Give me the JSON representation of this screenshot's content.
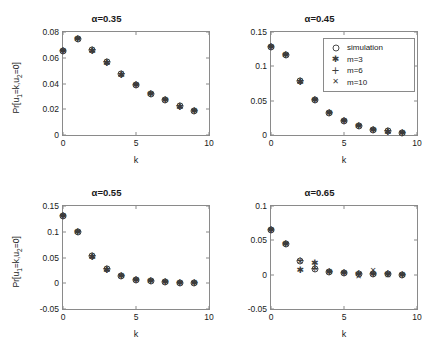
{
  "figure": {
    "background": "#ffffff",
    "axis_color": "#8a8a8a",
    "marker_color": "#3b3b3b"
  },
  "legend": {
    "position": "subplot-2-upper-right",
    "entries": [
      {
        "label": "simulation",
        "marker": "circle"
      },
      {
        "label": "m=3",
        "marker": "asterisk"
      },
      {
        "label": "m=6",
        "marker": "plus"
      },
      {
        "label": "m=10",
        "marker": "cross"
      }
    ]
  },
  "chart_data": [
    {
      "type": "scatter",
      "title": "α=0.35",
      "xlabel": "k",
      "ylabel": "Pr[u1=k,u2=0]",
      "xlim": [
        0,
        10
      ],
      "ylim": [
        0,
        0.08
      ],
      "xticks": [
        0,
        5,
        10
      ],
      "xticklabels": [
        "0",
        "5",
        "10"
      ],
      "yticks": [
        0,
        0.02,
        0.04,
        0.06,
        0.08
      ],
      "yticklabels": [
        "0",
        "0.02",
        "0.04",
        "0.06",
        "0.08"
      ],
      "grid": false,
      "x": [
        0,
        1,
        2,
        3,
        4,
        5,
        6,
        7,
        8,
        9
      ],
      "series": [
        {
          "name": "simulation",
          "marker": "circle",
          "values": [
            0.0655,
            0.0742,
            0.0662,
            0.0565,
            0.047,
            0.0388,
            0.0322,
            0.027,
            0.0222,
            0.0188
          ]
        },
        {
          "name": "m=3",
          "marker": "asterisk",
          "values": [
            0.0655,
            0.0742,
            0.0655,
            0.0562,
            0.0468,
            0.0387,
            0.0321,
            0.0269,
            0.0221,
            0.0187
          ]
        },
        {
          "name": "m=6",
          "marker": "plus",
          "values": [
            0.0655,
            0.0742,
            0.066,
            0.0564,
            0.047,
            0.0388,
            0.0322,
            0.027,
            0.0222,
            0.0188
          ]
        },
        {
          "name": "m=10",
          "marker": "cross",
          "values": [
            0.0655,
            0.0742,
            0.0661,
            0.0565,
            0.047,
            0.0388,
            0.0322,
            0.027,
            0.0222,
            0.0188
          ]
        }
      ]
    },
    {
      "type": "scatter",
      "title": "α=0.45",
      "xlabel": "k",
      "ylabel": "",
      "xlim": [
        0,
        10
      ],
      "ylim": [
        0,
        0.15
      ],
      "xticks": [
        0,
        5,
        10
      ],
      "xticklabels": [
        "0",
        "5",
        "10"
      ],
      "yticks": [
        0,
        0.05,
        0.1,
        0.15
      ],
      "yticklabels": [
        "0",
        "0.05",
        "0.1",
        "0.15"
      ],
      "grid": false,
      "x": [
        0,
        1,
        2,
        3,
        4,
        5,
        6,
        7,
        8,
        9
      ],
      "series": [
        {
          "name": "simulation",
          "marker": "circle",
          "values": [
            0.1282,
            0.1172,
            0.079,
            0.0515,
            0.0322,
            0.0208,
            0.0128,
            0.008,
            0.0052,
            0.0034
          ]
        },
        {
          "name": "m=3",
          "marker": "asterisk",
          "values": [
            0.1282,
            0.1172,
            0.0772,
            0.0505,
            0.0318,
            0.0205,
            0.0126,
            0.0078,
            0.005,
            0.0032
          ]
        },
        {
          "name": "m=6",
          "marker": "plus",
          "values": [
            0.1282,
            0.1172,
            0.0786,
            0.0512,
            0.0321,
            0.0207,
            0.0128,
            0.008,
            0.0052,
            0.0034
          ]
        },
        {
          "name": "m=10",
          "marker": "cross",
          "values": [
            0.1282,
            0.1172,
            0.0789,
            0.0514,
            0.0322,
            0.0208,
            0.0128,
            0.008,
            0.0052,
            0.0034
          ]
        }
      ]
    },
    {
      "type": "scatter",
      "title": "α=0.55",
      "xlabel": "k",
      "ylabel": "Pr[u1=k,u2=0]",
      "xlim": [
        0,
        10
      ],
      "ylim": [
        -0.05,
        0.15
      ],
      "xticks": [
        0,
        5,
        10
      ],
      "xticklabels": [
        "0",
        "5",
        "10"
      ],
      "yticks": [
        -0.05,
        0,
        0.05,
        0.1,
        0.15
      ],
      "yticklabels": [
        "-0.05",
        "0",
        "0.05",
        "0.1",
        "0.15"
      ],
      "grid": false,
      "x": [
        0,
        1,
        2,
        3,
        4,
        5,
        6,
        7,
        8,
        9
      ],
      "series": [
        {
          "name": "simulation",
          "marker": "circle",
          "values": [
            0.13,
            0.099,
            0.0535,
            0.0285,
            0.0148,
            0.0072,
            0.0036,
            0.002,
            0.0012,
            0.0008
          ]
        },
        {
          "name": "m=3",
          "marker": "asterisk",
          "values": [
            0.13,
            0.099,
            0.0505,
            0.0262,
            0.014,
            0.0068,
            0.0034,
            0.0018,
            0.001,
            0.0006
          ]
        },
        {
          "name": "m=6",
          "marker": "plus",
          "values": [
            0.13,
            0.099,
            0.053,
            0.0282,
            0.0147,
            0.0072,
            0.0036,
            0.002,
            0.0012,
            0.0008
          ]
        },
        {
          "name": "m=10",
          "marker": "cross",
          "values": [
            0.13,
            0.099,
            0.0534,
            0.0285,
            0.0148,
            0.0072,
            0.0036,
            0.002,
            0.0012,
            0.0008
          ]
        }
      ]
    },
    {
      "type": "scatter",
      "title": "α=0.65",
      "xlabel": "k",
      "ylabel": "",
      "xlim": [
        0,
        10
      ],
      "ylim": [
        -0.05,
        0.1
      ],
      "xticks": [
        0,
        5,
        10
      ],
      "xticklabels": [
        "0",
        "5",
        "10"
      ],
      "yticks": [
        -0.05,
        0,
        0.05,
        0.1
      ],
      "yticklabels": [
        "-0.05",
        "0",
        "0.05",
        "0.1"
      ],
      "grid": false,
      "x": [
        0,
        1,
        2,
        3,
        4,
        5,
        6,
        7,
        8,
        9
      ],
      "series": [
        {
          "name": "simulation",
          "marker": "circle",
          "values": [
            0.0655,
            0.0445,
            0.0195,
            0.0088,
            0.004,
            0.002,
            0.0008,
            0.0006,
            0.0004,
            0.0002
          ]
        },
        {
          "name": "m=3",
          "marker": "asterisk",
          "values": [
            0.0655,
            0.0445,
            0.0062,
            0.0175,
            0.004,
            0.002,
            0.0008,
            0.0006,
            0.0004,
            0.0002
          ]
        },
        {
          "name": "m=6",
          "marker": "plus",
          "values": [
            0.0655,
            0.0445,
            0.02,
            0.008,
            0.004,
            0.002,
            0.0008,
            0.0006,
            0.0004,
            0.0002
          ]
        },
        {
          "name": "m=10",
          "marker": "cross",
          "values": [
            0.0655,
            0.0445,
            0.019,
            0.0085,
            0.004,
            0.002,
            -0.003,
            0.0048,
            -0.0022,
            0.0002
          ]
        }
      ]
    }
  ]
}
